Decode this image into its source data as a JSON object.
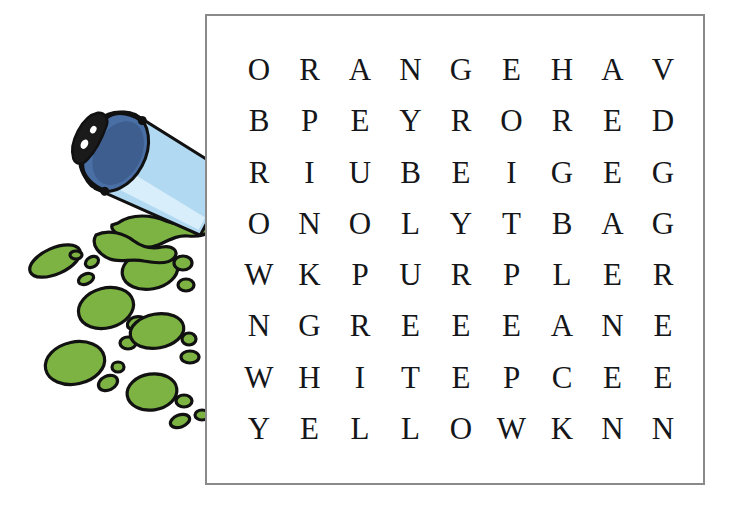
{
  "puzzle": {
    "type": "word-search",
    "rows": 8,
    "columns": 9,
    "grid": [
      [
        "O",
        "R",
        "A",
        "N",
        "G",
        "E",
        "H",
        "A",
        "V"
      ],
      [
        "B",
        "P",
        "E",
        "Y",
        "R",
        "O",
        "R",
        "E",
        "D"
      ],
      [
        "R",
        "I",
        "U",
        "B",
        "E",
        "I",
        "G",
        "E",
        "G"
      ],
      [
        "O",
        "N",
        "O",
        "L",
        "Y",
        "T",
        "B",
        "A",
        "G"
      ],
      [
        "W",
        "K",
        "P",
        "U",
        "R",
        "P",
        "L",
        "E",
        "R"
      ],
      [
        "N",
        "G",
        "R",
        "E",
        "E",
        "E",
        "A",
        "N",
        "E"
      ],
      [
        "W",
        "H",
        "I",
        "T",
        "E",
        "P",
        "C",
        "E",
        "E"
      ],
      [
        "Y",
        "E",
        "L",
        "L",
        "O",
        "W",
        "K",
        "N",
        "N"
      ]
    ],
    "border_color": "#8a8a8a",
    "letter_color": "#14161a",
    "background_color": "#ffffff"
  },
  "illustration": {
    "name": "tipped-paint-bucket-with-green-splatter",
    "bucket_body_color": "#b2d9f2",
    "bucket_highlight_color": "#d9eefb",
    "bucket_opening_color": "#4a6fa5",
    "bucket_opening_shadow_color": "#3d5e8f",
    "handle_color": "#111111",
    "grip_color": "#1a1a1a",
    "paint_color": "#7cb342",
    "paint_outline_color": "#111111"
  }
}
